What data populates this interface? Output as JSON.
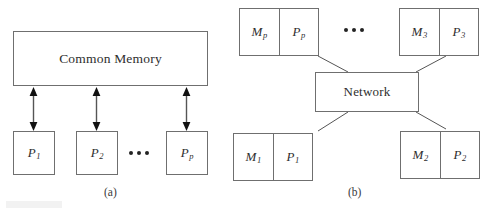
{
  "figure": {
    "background_color": "#ffffff",
    "line_color": "#6f6f6f",
    "text_color": "#2e2e2e",
    "panels": [
      {
        "caption": "(a)",
        "type": "shared-memory-architecture",
        "memory_box": {
          "label": "Common Memory"
        },
        "processors": [
          {
            "base": "P",
            "subscript": "1"
          },
          {
            "base": "P",
            "subscript": "2"
          },
          {
            "base": "P",
            "subscript": "p"
          }
        ],
        "ellipsis": "•••",
        "connector_type": "double-headed-arrow",
        "connector_count": 3
      },
      {
        "caption": "(b)",
        "type": "distributed-memory-architecture",
        "network_box": {
          "label": "Network"
        },
        "nodes": [
          {
            "position": "top-left",
            "memory": {
              "base": "M",
              "subscript": "p"
            },
            "processor": {
              "base": "P",
              "subscript": "p"
            }
          },
          {
            "position": "top-right",
            "memory": {
              "base": "M",
              "subscript": "3"
            },
            "processor": {
              "base": "P",
              "subscript": "3"
            }
          },
          {
            "position": "bottom-left",
            "memory": {
              "base": "M",
              "subscript": "1"
            },
            "processor": {
              "base": "P",
              "subscript": "1"
            }
          },
          {
            "position": "bottom-right",
            "memory": {
              "base": "M",
              "subscript": "2"
            },
            "processor": {
              "base": "P",
              "subscript": "2"
            }
          }
        ],
        "ellipsis": "•••",
        "connector_type": "plain-line",
        "connector_count": 4
      }
    ]
  }
}
